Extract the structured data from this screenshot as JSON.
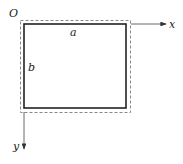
{
  "diagram": {
    "origin_label": "O",
    "x_axis_label": "x",
    "y_axis_label": "y",
    "width_label": "a",
    "height_label": "b",
    "colors": {
      "stroke": "#222222",
      "dashed": "#888888",
      "background": "#ffffff"
    }
  }
}
